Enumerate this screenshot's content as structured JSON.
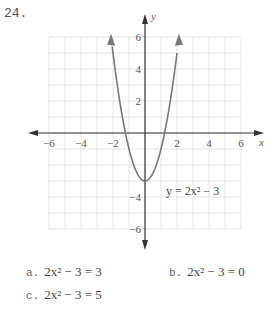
{
  "problem_number": "24.",
  "chart_data": {
    "type": "line",
    "title": "",
    "xlabel": "x",
    "ylabel": "y",
    "xlim": [
      -6,
      6
    ],
    "ylim": [
      -6,
      6
    ],
    "grid": true,
    "x_ticks": [
      "-6",
      "-4",
      "-2",
      "2",
      "4",
      "6"
    ],
    "y_ticks": [
      "6",
      "4",
      "2",
      "-4",
      "-6"
    ],
    "series": [
      {
        "name": "y = 2x² − 3",
        "equation": "y = 2x^2 - 3",
        "x": [
          -2.12,
          -1.5,
          -1,
          -0.5,
          0,
          0.5,
          1,
          1.5,
          2.12
        ],
        "y": [
          6,
          1.5,
          -1,
          -2.5,
          -3,
          -2.5,
          -1,
          1.5,
          6
        ]
      }
    ],
    "annotations": [
      "y = 2x² − 3"
    ]
  },
  "parts": [
    {
      "letter": "a.",
      "equation": "2x² − 3 = 3"
    },
    {
      "letter": "b.",
      "equation": "2x² − 3 = 0"
    },
    {
      "letter": "c.",
      "equation": "2x² − 3 = 5"
    }
  ]
}
